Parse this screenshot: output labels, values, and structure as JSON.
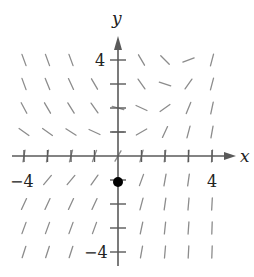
{
  "figure": {
    "kind": "slope-field",
    "width": 254,
    "height": 277,
    "colors": {
      "axis": "#5a5a5a",
      "segment": "#8c8c8c",
      "label": "#222222",
      "point": "#000000",
      "background": "#ffffff"
    },
    "mapping": {
      "origin_px": [
        118,
        156
      ],
      "unit_x_px": 23.5,
      "unit_y_px": 24,
      "segment_half_length_px": 6
    }
  },
  "axes": {
    "x_label": "x",
    "y_label": "y",
    "x_range": [
      -4,
      4
    ],
    "y_range": [
      -4,
      4
    ],
    "x_tick_labels": [
      {
        "value": -4,
        "text": "−4"
      },
      {
        "value": 4,
        "text": "4"
      }
    ],
    "y_tick_labels": [
      {
        "value": 4,
        "text": "4"
      },
      {
        "value": -4,
        "text": "−4"
      }
    ],
    "ticks": [
      -4,
      -3,
      -2,
      -1,
      1,
      2,
      3,
      4
    ]
  },
  "chart_data": {
    "type": "slope-field",
    "title": "",
    "xlabel": "x",
    "ylabel": "y",
    "xlim": [
      -4,
      4
    ],
    "ylim": [
      -4,
      4
    ],
    "grid": false,
    "segments_angle_deg": [
      {
        "y": 4,
        "x": [
          -4,
          -3,
          -2,
          1,
          2,
          3,
          4
        ],
        "angle": [
          -70,
          -70,
          -70,
          -60,
          -45,
          20,
          75
        ]
      },
      {
        "y": 3,
        "x": [
          -4,
          -3,
          -2,
          -1,
          1,
          2,
          3,
          4
        ],
        "angle": [
          -70,
          -68,
          -65,
          -60,
          -55,
          -18,
          55,
          75
        ]
      },
      {
        "y": 2,
        "x": [
          -4,
          -3,
          -2,
          -1,
          0,
          1,
          2,
          3,
          4
        ],
        "angle": [
          -62,
          -60,
          -58,
          -55,
          -15,
          -25,
          35,
          68,
          78
        ]
      },
      {
        "y": 1,
        "x": [
          -4,
          -3,
          -2,
          -1,
          0,
          1,
          2,
          3,
          4
        ],
        "angle": [
          -35,
          -35,
          -32,
          -25,
          0,
          30,
          65,
          75,
          80
        ]
      },
      {
        "y": 0,
        "x": [
          -4,
          -3,
          -2,
          -1,
          0,
          1,
          2,
          3,
          4
        ],
        "angle": [
          80,
          80,
          75,
          70,
          60,
          75,
          82,
          85,
          85
        ]
      },
      {
        "y": -1,
        "x": [
          -3,
          -2,
          -1,
          1,
          2,
          3
        ],
        "angle": [
          50,
          50,
          55,
          70,
          80,
          82
        ]
      },
      {
        "y": -2,
        "x": [
          -4,
          -3,
          -2,
          -1,
          1,
          2,
          3,
          4
        ],
        "angle": [
          65,
          65,
          65,
          65,
          75,
          82,
          85,
          87
        ]
      },
      {
        "y": -3,
        "x": [
          -4,
          -3,
          -2,
          -1,
          1,
          2,
          3,
          4
        ],
        "angle": [
          70,
          70,
          70,
          70,
          78,
          84,
          86,
          88
        ]
      },
      {
        "y": -4,
        "x": [
          -4,
          -3,
          -2,
          1,
          2,
          3,
          4
        ],
        "angle": [
          72,
          72,
          72,
          80,
          85,
          87,
          88
        ]
      }
    ],
    "marked_points": [
      {
        "x": 0,
        "y": -1,
        "label": "initial condition"
      }
    ]
  }
}
